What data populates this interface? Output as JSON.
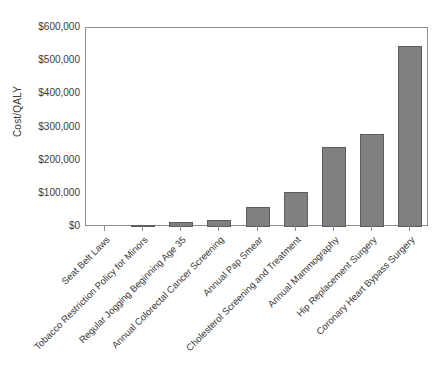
{
  "chart_data": {
    "type": "bar",
    "title": "",
    "xlabel": "",
    "ylabel": "Cost/QALY",
    "ylim": [
      0,
      600000
    ],
    "grid": false,
    "legend": "none",
    "y_tick_labels": [
      "$600,000",
      "$500,000",
      "$400,000",
      "$300,000",
      "$200,000",
      "$100,000",
      "$0"
    ],
    "y_tick_values": [
      600000,
      500000,
      400000,
      300000,
      200000,
      100000,
      0
    ],
    "categories": [
      "Seat Belt Laws",
      "Tobacco Restriction Policy for Minors",
      "Regular Jogging Beginning Age 35",
      "Annual Colorectal Cancer Screening",
      "Annual Pap Smear",
      "Cholesterol Screening and Treatment",
      "Annual Mammography",
      "Hip Replacement Surgery",
      "Coronary Heart Bypass Surgery"
    ],
    "values": [
      0,
      5000,
      15000,
      22000,
      60000,
      105000,
      240000,
      280000,
      545000
    ],
    "bar_color": "#808080",
    "bar_edge_color": "#5d5d5d",
    "axis_color": "#8e8e8e",
    "background_color": "#ffffff"
  }
}
